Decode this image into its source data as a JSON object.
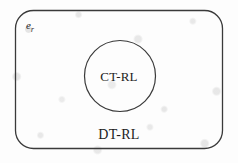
{
  "figure": {
    "caption_text": "",
    "background_color": "#f0f0f0",
    "stroke_color": "#3a3a3a",
    "text_color": "#1c1c1c"
  },
  "diagram": {
    "type": "set-containment-venn",
    "universe": {
      "symbol_base": "e",
      "symbol_subscript": "r",
      "shape": "rounded-rectangle"
    },
    "outer_set": {
      "label": "DT-RL",
      "shape": "rounded-rectangle",
      "bounds": {
        "x": 15,
        "y": 10,
        "width": 208,
        "height": 139,
        "corner_radius": 18
      }
    },
    "inner_set": {
      "label": "CT-RL",
      "shape": "circle",
      "center": {
        "x": 120,
        "y": 76
      },
      "radius": 36
    }
  }
}
